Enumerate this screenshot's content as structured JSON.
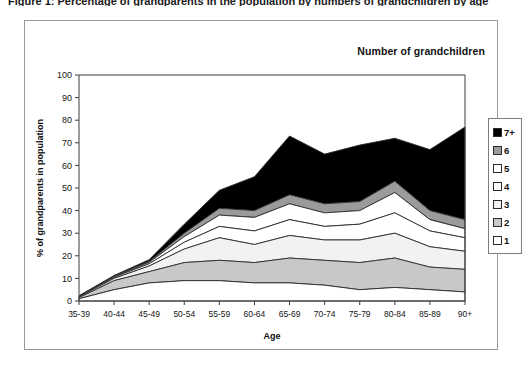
{
  "document": {
    "title": "Figure 1: Percentage of grandparents in the population by numbers of grandchildren by age"
  },
  "chart": {
    "inner_title": "Number of grandchildren",
    "axis": {
      "xlabel": "Age",
      "ylabel": "% of grandparents in population"
    }
  },
  "legend": {
    "entries": [
      {
        "label": "7+",
        "color": "#000000"
      },
      {
        "label": "6",
        "color": "#9b9b9b"
      },
      {
        "label": "5",
        "color": "#ffffff"
      },
      {
        "label": "4",
        "color": "#ffffff"
      },
      {
        "label": "3",
        "color": "#f2f2f2"
      },
      {
        "label": "2",
        "color": "#c8c8c8"
      },
      {
        "label": "1",
        "color": "#ffffff"
      }
    ]
  },
  "chart_data": {
    "type": "area",
    "stacked": true,
    "title": "Number of grandchildren",
    "xlabel": "Age",
    "ylabel": "% of grandparents in population",
    "ylim": [
      0,
      100
    ],
    "yticks": [
      0,
      10,
      20,
      30,
      40,
      50,
      60,
      70,
      80,
      90,
      100
    ],
    "grid": false,
    "legend_position": "right",
    "categories": [
      "35-39",
      "40-44",
      "45-49",
      "50-54",
      "55-59",
      "60-64",
      "65-69",
      "70-74",
      "75-79",
      "80-84",
      "85-89",
      "90+"
    ],
    "series": [
      {
        "name": "1",
        "color": "#ffffff",
        "values": [
          1.0,
          5.0,
          8.0,
          9.0,
          9.0,
          8.0,
          8.0,
          7.0,
          5.0,
          6.0,
          5.0,
          4.0
        ]
      },
      {
        "name": "2",
        "color": "#c8c8c8",
        "values": [
          0.5,
          4.0,
          5.0,
          8.0,
          9.0,
          9.0,
          11.0,
          11.0,
          12.0,
          13.0,
          10.0,
          10.0
        ]
      },
      {
        "name": "3",
        "color": "#f2f2f2",
        "values": [
          0.3,
          1.0,
          2.5,
          6.0,
          10.0,
          8.0,
          10.0,
          9.0,
          10.0,
          11.0,
          9.0,
          8.0
        ]
      },
      {
        "name": "4",
        "color": "#ffffff",
        "values": [
          0.2,
          0.5,
          1.0,
          3.0,
          5.0,
          6.0,
          7.0,
          6.0,
          7.0,
          9.0,
          7.0,
          6.0
        ]
      },
      {
        "name": "5",
        "color": "#ffffff",
        "values": [
          0.1,
          0.3,
          0.6,
          2.5,
          5.0,
          6.0,
          7.0,
          6.0,
          6.0,
          9.0,
          5.0,
          4.0
        ]
      },
      {
        "name": "6",
        "color": "#9b9b9b",
        "values": [
          0.1,
          0.2,
          0.4,
          1.5,
          3.0,
          3.0,
          4.0,
          4.0,
          4.0,
          5.0,
          4.0,
          4.0
        ]
      },
      {
        "name": "7+",
        "color": "#000000",
        "values": [
          0.1,
          0.3,
          0.8,
          4.0,
          8.0,
          15.0,
          26.0,
          22.0,
          25.0,
          19.0,
          27.0,
          41.0
        ]
      }
    ]
  }
}
